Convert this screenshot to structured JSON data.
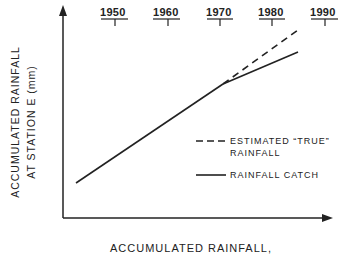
{
  "timeline": {
    "years": [
      "1950",
      "1960",
      "1970",
      "1980",
      "1990"
    ]
  },
  "axes": {
    "ylabel_line1": "ACCUMULATED RAINFALL",
    "ylabel_line2": "AT STATION E (mm)",
    "xlabel": "ACCUMULATED RAINFALL,"
  },
  "legend": {
    "dashed_line1": "ESTIMATED “TRUE”",
    "dashed_line2": "RAINFALL",
    "solid": "RAINFALL CATCH"
  },
  "colors": {
    "ink": "#222222",
    "background": "#ffffff"
  }
}
